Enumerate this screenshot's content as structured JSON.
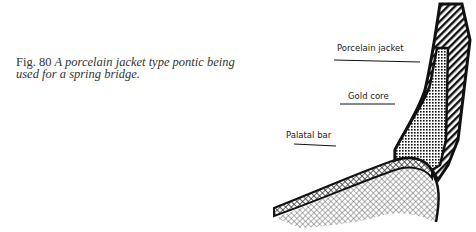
{
  "caption": {
    "figure_number": "Fig. 80",
    "text": "A porcelain jacket type pontic being used for a spring bridge."
  },
  "labels": {
    "porcelain_jacket": "Porcelain jacket",
    "gold_core": "Gold core",
    "palatal_bar": "Palatal bar"
  },
  "colors": {
    "ink": "#111111",
    "hatch_gray": "#555555",
    "background": "#ffffff"
  }
}
